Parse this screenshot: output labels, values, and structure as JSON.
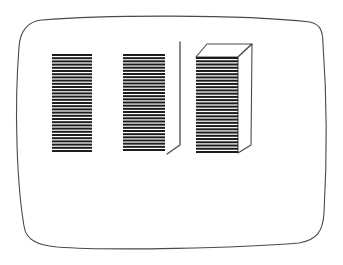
{
  "figure": {
    "background_color": "#ffffff",
    "line_color": "#4a4a4a",
    "stripe_color": "#1c1c1c"
  },
  "canvas": {
    "width": 343,
    "height": 265
  },
  "screen_outline": {
    "path": "M42,20 C100,15 240,14 310,22 C319,24 323,29 323,44 C327,100 327,160 324,213 C323,231 317,240 299,243 C240,248 110,251 57,247 C37,245 26,240 24,226 C17,185 14,110 19,47 C20,31 28,21 42,20 Z",
    "stroke_width": 1.1
  },
  "stripes": {
    "period": 3.2,
    "bar_thickness": 2
  },
  "panels": [
    {
      "id": "striped-panel-1",
      "x": 52,
      "y": 54,
      "width": 40,
      "height": 98
    },
    {
      "id": "striped-panel-2",
      "x": 123,
      "y": 54,
      "width": 42,
      "height": 97
    },
    {
      "id": "striped-panel-3-front",
      "x": 196,
      "y": 57,
      "width": 42,
      "height": 96
    }
  ],
  "depth_edge": {
    "points": "167,154 180,145 180,42",
    "stroke_width": 1.3
  },
  "box": {
    "top_face_points": "196,57 207,44 252,44 238,57",
    "right_face_points": "238,57 252,44 251,145 238,153",
    "stroke_width": 1.1
  }
}
